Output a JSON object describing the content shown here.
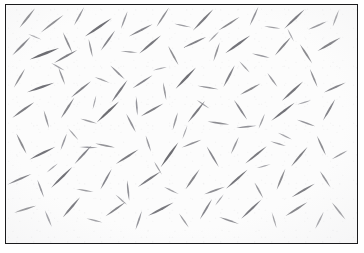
{
  "figure": {
    "kind": "micrograph",
    "width": 364,
    "height": 253,
    "background_color": "#ffffff"
  },
  "plate": {
    "frame": {
      "x": 5,
      "y": 4,
      "width": 353,
      "height": 240,
      "border_width": 1.5,
      "border_color": "#1b1b1d"
    },
    "field": {
      "background_color": "#fcfcfc",
      "particle_color": "#6e6e74",
      "particle_color_dark": "#3d3d43",
      "particle_color_light": "#a9a9b0"
    }
  },
  "specimen": {
    "label": "needle-crystal-field",
    "particle_count": 150,
    "particles": [
      {
        "x": 22,
        "y": 14,
        "len": 26,
        "w": 2.2,
        "ang": -52,
        "tone": 0.62
      },
      {
        "x": 48,
        "y": 20,
        "len": 30,
        "w": 2.0,
        "ang": -38,
        "tone": 0.55
      },
      {
        "x": 76,
        "y": 12,
        "len": 22,
        "w": 1.8,
        "ang": -62,
        "tone": 0.48
      },
      {
        "x": 96,
        "y": 24,
        "len": 34,
        "w": 2.6,
        "ang": -35,
        "tone": 0.72
      },
      {
        "x": 123,
        "y": 16,
        "len": 20,
        "w": 1.7,
        "ang": -70,
        "tone": 0.45
      },
      {
        "x": 140,
        "y": 27,
        "len": 28,
        "w": 2.1,
        "ang": -28,
        "tone": 0.58
      },
      {
        "x": 163,
        "y": 13,
        "len": 24,
        "w": 1.9,
        "ang": -58,
        "tone": 0.52
      },
      {
        "x": 184,
        "y": 22,
        "len": 18,
        "w": 1.6,
        "ang": 12,
        "tone": 0.44
      },
      {
        "x": 205,
        "y": 16,
        "len": 31,
        "w": 2.3,
        "ang": -47,
        "tone": 0.66
      },
      {
        "x": 232,
        "y": 20,
        "len": 26,
        "w": 2.0,
        "ang": -33,
        "tone": 0.56
      },
      {
        "x": 258,
        "y": 12,
        "len": 22,
        "w": 1.8,
        "ang": -66,
        "tone": 0.5
      },
      {
        "x": 277,
        "y": 24,
        "len": 17,
        "w": 1.5,
        "ang": 8,
        "tone": 0.42
      },
      {
        "x": 300,
        "y": 15,
        "len": 29,
        "w": 2.4,
        "ang": -44,
        "tone": 0.69
      },
      {
        "x": 324,
        "y": 22,
        "len": 21,
        "w": 1.8,
        "ang": -24,
        "tone": 0.51
      },
      {
        "x": 343,
        "y": 14,
        "len": 19,
        "w": 1.7,
        "ang": -70,
        "tone": 0.47
      },
      {
        "x": 16,
        "y": 44,
        "len": 27,
        "w": 2.2,
        "ang": -46,
        "tone": 0.6
      },
      {
        "x": 40,
        "y": 52,
        "len": 33,
        "w": 2.7,
        "ang": -22,
        "tone": 0.74
      },
      {
        "x": 64,
        "y": 40,
        "len": 24,
        "w": 1.9,
        "ang": 66,
        "tone": 0.53
      },
      {
        "x": 62,
        "y": 55,
        "len": 28,
        "w": 2.2,
        "ang": -30,
        "tone": 0.62
      },
      {
        "x": 88,
        "y": 46,
        "len": 20,
        "w": 1.7,
        "ang": 78,
        "tone": 0.46
      },
      {
        "x": 106,
        "y": 38,
        "len": 26,
        "w": 2.1,
        "ang": -55,
        "tone": 0.58
      },
      {
        "x": 128,
        "y": 50,
        "len": 18,
        "w": 1.6,
        "ang": 5,
        "tone": 0.43
      },
      {
        "x": 150,
        "y": 42,
        "len": 30,
        "w": 2.4,
        "ang": -41,
        "tone": 0.67
      },
      {
        "x": 174,
        "y": 54,
        "len": 23,
        "w": 1.9,
        "ang": 62,
        "tone": 0.52
      },
      {
        "x": 196,
        "y": 40,
        "len": 27,
        "w": 2.2,
        "ang": -26,
        "tone": 0.61
      },
      {
        "x": 219,
        "y": 50,
        "len": 21,
        "w": 1.8,
        "ang": -72,
        "tone": 0.49
      },
      {
        "x": 241,
        "y": 42,
        "len": 32,
        "w": 2.5,
        "ang": -36,
        "tone": 0.7
      },
      {
        "x": 265,
        "y": 54,
        "len": 19,
        "w": 1.7,
        "ang": 14,
        "tone": 0.45
      },
      {
        "x": 288,
        "y": 44,
        "len": 26,
        "w": 2.1,
        "ang": -50,
        "tone": 0.59
      },
      {
        "x": 312,
        "y": 52,
        "len": 24,
        "w": 2.0,
        "ang": 58,
        "tone": 0.55
      },
      {
        "x": 336,
        "y": 42,
        "len": 28,
        "w": 2.3,
        "ang": -31,
        "tone": 0.64
      },
      {
        "x": 14,
        "y": 78,
        "len": 23,
        "w": 1.9,
        "ang": -60,
        "tone": 0.52
      },
      {
        "x": 36,
        "y": 88,
        "len": 30,
        "w": 2.5,
        "ang": -20,
        "tone": 0.71
      },
      {
        "x": 58,
        "y": 76,
        "len": 20,
        "w": 1.7,
        "ang": 70,
        "tone": 0.47
      },
      {
        "x": 78,
        "y": 90,
        "len": 27,
        "w": 2.2,
        "ang": -40,
        "tone": 0.61
      },
      {
        "x": 100,
        "y": 80,
        "len": 17,
        "w": 1.5,
        "ang": 22,
        "tone": 0.41
      },
      {
        "x": 118,
        "y": 92,
        "len": 29,
        "w": 2.3,
        "ang": -55,
        "tone": 0.65
      },
      {
        "x": 116,
        "y": 72,
        "len": 21,
        "w": 1.8,
        "ang": 44,
        "tone": 0.5
      },
      {
        "x": 142,
        "y": 82,
        "len": 25,
        "w": 2.0,
        "ang": -34,
        "tone": 0.57
      },
      {
        "x": 165,
        "y": 92,
        "len": 19,
        "w": 1.7,
        "ang": 80,
        "tone": 0.46
      },
      {
        "x": 187,
        "y": 78,
        "len": 31,
        "w": 2.5,
        "ang": -47,
        "tone": 0.72
      },
      {
        "x": 210,
        "y": 88,
        "len": 22,
        "w": 1.8,
        "ang": 10,
        "tone": 0.49
      },
      {
        "x": 232,
        "y": 76,
        "len": 26,
        "w": 2.1,
        "ang": -63,
        "tone": 0.6
      },
      {
        "x": 254,
        "y": 90,
        "len": 24,
        "w": 2.0,
        "ang": -29,
        "tone": 0.56
      },
      {
        "x": 277,
        "y": 80,
        "len": 18,
        "w": 1.6,
        "ang": 55,
        "tone": 0.44
      },
      {
        "x": 298,
        "y": 92,
        "len": 30,
        "w": 2.4,
        "ang": -43,
        "tone": 0.68
      },
      {
        "x": 320,
        "y": 78,
        "len": 21,
        "w": 1.8,
        "ang": 68,
        "tone": 0.51
      },
      {
        "x": 342,
        "y": 88,
        "len": 25,
        "w": 2.0,
        "ang": -25,
        "tone": 0.58
      },
      {
        "x": 18,
        "y": 112,
        "len": 28,
        "w": 2.3,
        "ang": -36,
        "tone": 0.63
      },
      {
        "x": 42,
        "y": 122,
        "len": 20,
        "w": 1.7,
        "ang": 74,
        "tone": 0.47
      },
      {
        "x": 64,
        "y": 110,
        "len": 26,
        "w": 2.1,
        "ang": -58,
        "tone": 0.59
      },
      {
        "x": 86,
        "y": 124,
        "len": 18,
        "w": 1.6,
        "ang": 16,
        "tone": 0.43
      },
      {
        "x": 106,
        "y": 114,
        "len": 32,
        "w": 2.6,
        "ang": -44,
        "tone": 0.73
      },
      {
        "x": 130,
        "y": 126,
        "len": 22,
        "w": 1.8,
        "ang": 63,
        "tone": 0.5
      },
      {
        "x": 152,
        "y": 112,
        "len": 27,
        "w": 2.2,
        "ang": -30,
        "tone": 0.62
      },
      {
        "x": 176,
        "y": 124,
        "len": 19,
        "w": 1.7,
        "ang": -74,
        "tone": 0.46
      },
      {
        "x": 198,
        "y": 114,
        "len": 29,
        "w": 2.3,
        "ang": -52,
        "tone": 0.66
      },
      {
        "x": 221,
        "y": 126,
        "len": 23,
        "w": 1.9,
        "ang": 8,
        "tone": 0.53
      },
      {
        "x": 244,
        "y": 112,
        "len": 25,
        "w": 2.0,
        "ang": 57,
        "tone": 0.57
      },
      {
        "x": 266,
        "y": 124,
        "len": 17,
        "w": 1.5,
        "ang": -68,
        "tone": 0.42
      },
      {
        "x": 288,
        "y": 114,
        "len": 31,
        "w": 2.5,
        "ang": -38,
        "tone": 0.7
      },
      {
        "x": 312,
        "y": 126,
        "len": 20,
        "w": 1.7,
        "ang": 20,
        "tone": 0.48
      },
      {
        "x": 336,
        "y": 112,
        "len": 26,
        "w": 2.1,
        "ang": -61,
        "tone": 0.6
      },
      {
        "x": 16,
        "y": 148,
        "len": 24,
        "w": 2.0,
        "ang": 64,
        "tone": 0.55
      },
      {
        "x": 38,
        "y": 158,
        "len": 30,
        "w": 2.4,
        "ang": -27,
        "tone": 0.69
      },
      {
        "x": 60,
        "y": 146,
        "len": 19,
        "w": 1.7,
        "ang": -70,
        "tone": 0.45
      },
      {
        "x": 80,
        "y": 160,
        "len": 26,
        "w": 2.1,
        "ang": -48,
        "tone": 0.6
      },
      {
        "x": 103,
        "y": 150,
        "len": 21,
        "w": 1.8,
        "ang": 12,
        "tone": 0.49
      },
      {
        "x": 126,
        "y": 162,
        "len": 28,
        "w": 2.3,
        "ang": -33,
        "tone": 0.64
      },
      {
        "x": 148,
        "y": 148,
        "len": 18,
        "w": 1.6,
        "ang": 72,
        "tone": 0.44
      },
      {
        "x": 170,
        "y": 160,
        "len": 32,
        "w": 2.6,
        "ang": -55,
        "tone": 0.74
      },
      {
        "x": 193,
        "y": 148,
        "len": 22,
        "w": 1.8,
        "ang": -22,
        "tone": 0.51
      },
      {
        "x": 215,
        "y": 162,
        "len": 25,
        "w": 2.0,
        "ang": 60,
        "tone": 0.57
      },
      {
        "x": 238,
        "y": 150,
        "len": 20,
        "w": 1.7,
        "ang": -66,
        "tone": 0.47
      },
      {
        "x": 260,
        "y": 160,
        "len": 29,
        "w": 2.3,
        "ang": -40,
        "tone": 0.66
      },
      {
        "x": 283,
        "y": 148,
        "len": 17,
        "w": 1.5,
        "ang": 18,
        "tone": 0.42
      },
      {
        "x": 305,
        "y": 162,
        "len": 27,
        "w": 2.2,
        "ang": -51,
        "tone": 0.62
      },
      {
        "x": 328,
        "y": 150,
        "len": 23,
        "w": 1.9,
        "ang": 66,
        "tone": 0.53
      },
      {
        "x": 347,
        "y": 160,
        "len": 19,
        "w": 1.7,
        "ang": -30,
        "tone": 0.46
      },
      {
        "x": 14,
        "y": 186,
        "len": 27,
        "w": 2.2,
        "ang": -24,
        "tone": 0.61
      },
      {
        "x": 36,
        "y": 196,
        "len": 20,
        "w": 1.7,
        "ang": 70,
        "tone": 0.48
      },
      {
        "x": 58,
        "y": 184,
        "len": 31,
        "w": 2.5,
        "ang": -45,
        "tone": 0.71
      },
      {
        "x": 82,
        "y": 198,
        "len": 18,
        "w": 1.6,
        "ang": 10,
        "tone": 0.43
      },
      {
        "x": 104,
        "y": 186,
        "len": 25,
        "w": 2.0,
        "ang": -62,
        "tone": 0.57
      },
      {
        "x": 127,
        "y": 198,
        "len": 22,
        "w": 1.8,
        "ang": 84,
        "tone": 0.5
      },
      {
        "x": 149,
        "y": 186,
        "len": 29,
        "w": 2.3,
        "ang": -35,
        "tone": 0.65
      },
      {
        "x": 172,
        "y": 198,
        "len": 17,
        "w": 1.5,
        "ang": 26,
        "tone": 0.41
      },
      {
        "x": 194,
        "y": 186,
        "len": 26,
        "w": 2.1,
        "ang": -56,
        "tone": 0.59
      },
      {
        "x": 217,
        "y": 198,
        "len": 23,
        "w": 1.9,
        "ang": -20,
        "tone": 0.53
      },
      {
        "x": 240,
        "y": 186,
        "len": 30,
        "w": 2.4,
        "ang": -42,
        "tone": 0.68
      },
      {
        "x": 263,
        "y": 198,
        "len": 19,
        "w": 1.7,
        "ang": 62,
        "tone": 0.46
      },
      {
        "x": 286,
        "y": 186,
        "len": 24,
        "w": 2.0,
        "ang": -68,
        "tone": 0.55
      },
      {
        "x": 309,
        "y": 198,
        "len": 28,
        "w": 2.3,
        "ang": -31,
        "tone": 0.63
      },
      {
        "x": 332,
        "y": 186,
        "len": 21,
        "w": 1.8,
        "ang": 58,
        "tone": 0.49
      },
      {
        "x": 20,
        "y": 218,
        "len": 24,
        "w": 2.0,
        "ang": -18,
        "tone": 0.56
      },
      {
        "x": 44,
        "y": 228,
        "len": 19,
        "w": 1.7,
        "ang": 68,
        "tone": 0.45
      },
      {
        "x": 68,
        "y": 216,
        "len": 28,
        "w": 2.3,
        "ang": -50,
        "tone": 0.64
      },
      {
        "x": 92,
        "y": 230,
        "len": 17,
        "w": 1.5,
        "ang": 14,
        "tone": 0.4
      },
      {
        "x": 114,
        "y": 218,
        "len": 26,
        "w": 2.1,
        "ang": -36,
        "tone": 0.59
      },
      {
        "x": 138,
        "y": 230,
        "len": 21,
        "w": 1.8,
        "ang": -72,
        "tone": 0.48
      },
      {
        "x": 161,
        "y": 218,
        "len": 30,
        "w": 2.4,
        "ang": -28,
        "tone": 0.67
      },
      {
        "x": 185,
        "y": 230,
        "len": 18,
        "w": 1.6,
        "ang": 56,
        "tone": 0.43
      },
      {
        "x": 208,
        "y": 218,
        "len": 25,
        "w": 2.0,
        "ang": -60,
        "tone": 0.57
      },
      {
        "x": 232,
        "y": 230,
        "len": 22,
        "w": 1.8,
        "ang": 20,
        "tone": 0.51
      },
      {
        "x": 255,
        "y": 218,
        "len": 29,
        "w": 2.3,
        "ang": -44,
        "tone": 0.65
      },
      {
        "x": 279,
        "y": 230,
        "len": 17,
        "w": 1.5,
        "ang": 74,
        "tone": 0.41
      },
      {
        "x": 302,
        "y": 218,
        "len": 27,
        "w": 2.2,
        "ang": -33,
        "tone": 0.62
      },
      {
        "x": 326,
        "y": 230,
        "len": 20,
        "w": 1.7,
        "ang": -64,
        "tone": 0.47
      },
      {
        "x": 346,
        "y": 220,
        "len": 23,
        "w": 1.9,
        "ang": 52,
        "tone": 0.53
      },
      {
        "x": 54,
        "y": 66,
        "len": 16,
        "w": 1.4,
        "ang": 30,
        "tone": 0.38
      },
      {
        "x": 160,
        "y": 68,
        "len": 15,
        "w": 1.3,
        "ang": -14,
        "tone": 0.36
      },
      {
        "x": 248,
        "y": 66,
        "len": 16,
        "w": 1.4,
        "ang": 48,
        "tone": 0.39
      },
      {
        "x": 92,
        "y": 104,
        "len": 15,
        "w": 1.3,
        "ang": -76,
        "tone": 0.37
      },
      {
        "x": 205,
        "y": 106,
        "len": 16,
        "w": 1.4,
        "ang": 34,
        "tone": 0.38
      },
      {
        "x": 310,
        "y": 104,
        "len": 15,
        "w": 1.3,
        "ang": -18,
        "tone": 0.36
      },
      {
        "x": 70,
        "y": 138,
        "len": 16,
        "w": 1.4,
        "ang": 50,
        "tone": 0.39
      },
      {
        "x": 186,
        "y": 136,
        "len": 15,
        "w": 1.3,
        "ang": -70,
        "tone": 0.35
      },
      {
        "x": 290,
        "y": 140,
        "len": 16,
        "w": 1.4,
        "ang": 26,
        "tone": 0.38
      },
      {
        "x": 48,
        "y": 174,
        "len": 15,
        "w": 1.3,
        "ang": -40,
        "tone": 0.36
      },
      {
        "x": 158,
        "y": 174,
        "len": 16,
        "w": 1.4,
        "ang": 60,
        "tone": 0.39
      },
      {
        "x": 268,
        "y": 172,
        "len": 15,
        "w": 1.3,
        "ang": -16,
        "tone": 0.35
      },
      {
        "x": 120,
        "y": 208,
        "len": 16,
        "w": 1.4,
        "ang": 42,
        "tone": 0.38
      },
      {
        "x": 222,
        "y": 208,
        "len": 15,
        "w": 1.3,
        "ang": -54,
        "tone": 0.36
      },
      {
        "x": 30,
        "y": 34,
        "len": 15,
        "w": 1.3,
        "ang": 24,
        "tone": 0.35
      },
      {
        "x": 216,
        "y": 34,
        "len": 16,
        "w": 1.4,
        "ang": -46,
        "tone": 0.38
      },
      {
        "x": 296,
        "y": 32,
        "len": 15,
        "w": 1.3,
        "ang": 64,
        "tone": 0.36
      },
      {
        "x": 136,
        "y": 108,
        "len": 20,
        "w": 1.7,
        "ang": 86,
        "tone": 0.48
      },
      {
        "x": 250,
        "y": 130,
        "len": 21,
        "w": 1.8,
        "ang": -6,
        "tone": 0.5
      },
      {
        "x": 86,
        "y": 152,
        "len": 19,
        "w": 1.6,
        "ang": 2,
        "tone": 0.45
      }
    ]
  }
}
